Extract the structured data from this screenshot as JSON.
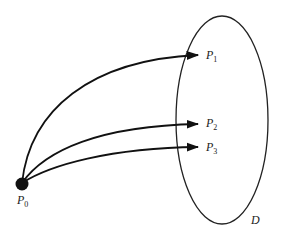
{
  "diagram": {
    "region": {
      "label": "D",
      "cx": 222,
      "cy": 120,
      "rx": 46,
      "ry": 104,
      "stroke": "#222222"
    },
    "source": {
      "label_base": "P",
      "label_sub": "0",
      "x": 22,
      "y": 184,
      "r": 6,
      "fill": "#111111"
    },
    "targets": [
      {
        "label_base": "P",
        "label_sub": "1",
        "x": 198,
        "y": 55
      },
      {
        "label_base": "P",
        "label_sub": "2",
        "x": 198,
        "y": 124
      },
      {
        "label_base": "P",
        "label_sub": "3",
        "x": 198,
        "y": 147
      }
    ],
    "arrow_color": "#111111"
  }
}
